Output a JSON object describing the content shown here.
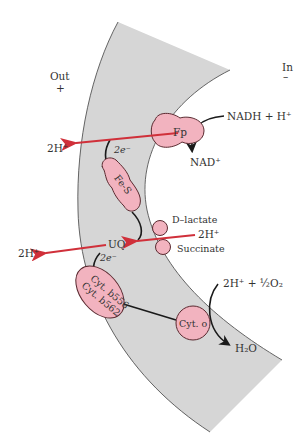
{
  "regions": {
    "outside_label": "Out",
    "outside_sign": "+",
    "inside_label": "In",
    "inside_sign": "–"
  },
  "complexes": {
    "fp": "Fp",
    "fes": "Fe-S",
    "uq": "UQ",
    "cyt_b_line1": "Cyt. b556",
    "cyt_b_line2": "Cyt. b562",
    "cyt_o": "Cyt. o",
    "d_lactate": "D–lactate",
    "succinate": "Succinate"
  },
  "reactions": {
    "nadh": "NADH + H⁺",
    "nad": "NAD⁺",
    "oxygen": "2H⁺ + ½O₂",
    "water": "H₂O",
    "proton_in_lactate": "2H⁺",
    "proton_out_1": "2H⁺",
    "proton_out_2": "2H⁺",
    "electrons_1": "2e⁻",
    "electrons_2": "2e⁻"
  },
  "colors": {
    "membrane": "#d6d6d6",
    "membrane_edge": "#555555",
    "protein_fill": "#f2b3bf",
    "protein_edge": "#5a2a30",
    "proton_arrow": "#d0303a",
    "electron_arrow": "#1a1a1a"
  }
}
